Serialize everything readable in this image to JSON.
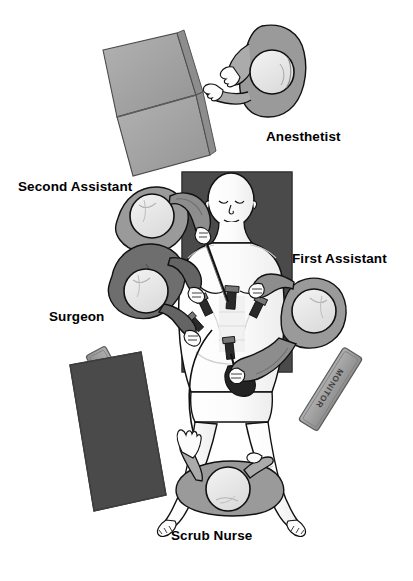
{
  "diagram": {
    "type": "overhead-schematic",
    "background_color": "#ffffff"
  },
  "labels": {
    "anesthetist": "Anesthetist",
    "second_assistant": "Second Assistant",
    "first_assistant": "First Assistant",
    "surgeon": "Surgeon",
    "scrub_nurse": "Scrub Nurse"
  },
  "equipment": {
    "monitor_left_text": "MONITOR",
    "monitor_right_text": "MONITOR",
    "anesthesia_machine_name": "anesthesia-machine",
    "instrument_table_name": "instrument-table",
    "operating_table_name": "operating-table"
  },
  "colors": {
    "gown_gray": "#9a9a9a",
    "gown_dark": "#6e6e6e",
    "table_dark": "#4c4c4c",
    "machine_gray": "#a3a3a3",
    "monitor_gray": "#9d9d9d",
    "cap_light": "#e8e8e8",
    "skin": "#fdfdfd",
    "outline": "#111111",
    "label_text": "#000000"
  },
  "people": [
    {
      "role": "Anesthetist",
      "position": "head-end-right",
      "view": "overhead"
    },
    {
      "role": "Second Assistant",
      "position": "patient-left-upper",
      "view": "overhead"
    },
    {
      "role": "Surgeon",
      "position": "patient-left-lower",
      "view": "overhead"
    },
    {
      "role": "First Assistant",
      "position": "patient-right",
      "view": "overhead"
    },
    {
      "role": "Scrub Nurse",
      "position": "foot-end",
      "view": "overhead"
    }
  ],
  "patient": {
    "name": "patient",
    "position": "supine-center",
    "procedure": "laparoscopic",
    "trocar_count": 5
  }
}
